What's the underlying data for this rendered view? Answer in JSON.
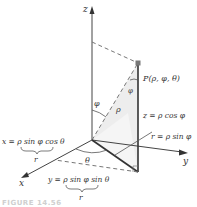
{
  "diagram": {
    "axes": {
      "z": "z",
      "y": "y",
      "x": "x"
    },
    "point_label": "P(ρ, φ, θ)",
    "angle_phi": "φ",
    "angle_phi2": "φ",
    "angle_theta": "θ",
    "rho_label": "ρ",
    "z_eq": "z = ρ cos φ",
    "r_eq": "r = ρ sin φ",
    "x_eq": "x = ρ sin φ cos θ",
    "x_brace_label": "r",
    "y_eq": "y = ρ sin φ sin θ",
    "y_brace_label": "r",
    "caption": "FIGURE 14.56"
  }
}
